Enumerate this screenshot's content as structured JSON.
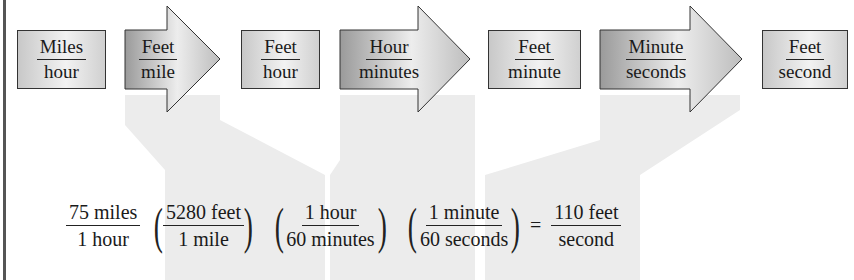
{
  "diagram": {
    "boxes": [
      {
        "num": "Miles",
        "den": "hour"
      },
      {
        "num": "Feet",
        "den": "hour"
      },
      {
        "num": "Feet",
        "den": "minute"
      },
      {
        "num": "Feet",
        "den": "second"
      }
    ],
    "arrows": [
      {
        "num": "Feet",
        "den": "mile"
      },
      {
        "num": "Hour",
        "den": "minutes"
      },
      {
        "num": "Minute",
        "den": "seconds"
      }
    ],
    "equation": {
      "start": {
        "num": "75 miles",
        "den": "1 hour"
      },
      "factors": [
        {
          "num": "5280 feet",
          "den": "1 mile"
        },
        {
          "num": "1 hour",
          "den": "60 minutes"
        },
        {
          "num": "1 minute",
          "den": "60 seconds"
        }
      ],
      "equals": "=",
      "result": {
        "num": "110 feet",
        "den": "second"
      }
    },
    "colors": {
      "shade": "#ececec",
      "box_border": "#333333",
      "arrow_dark": "#9a9a9a",
      "arrow_light": "#e6e6e6"
    }
  }
}
